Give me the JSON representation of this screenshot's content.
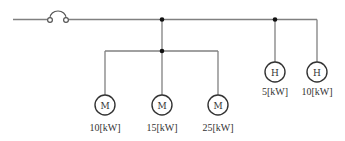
{
  "diagram": {
    "type": "single-line electrical circuit",
    "colors": {
      "wire": "#808080",
      "junction": "#111111",
      "symbol": "#333333"
    },
    "supply": {
      "symbol": "fuse-icon"
    },
    "motors": [
      {
        "symbol": "M",
        "rating": "10[kW]"
      },
      {
        "symbol": "M",
        "rating": "15[kW]"
      },
      {
        "symbol": "M",
        "rating": "25[kW]"
      }
    ],
    "heaters": [
      {
        "symbol": "H",
        "rating": "5[kW]"
      },
      {
        "symbol": "H",
        "rating": "10[kW]"
      }
    ]
  }
}
